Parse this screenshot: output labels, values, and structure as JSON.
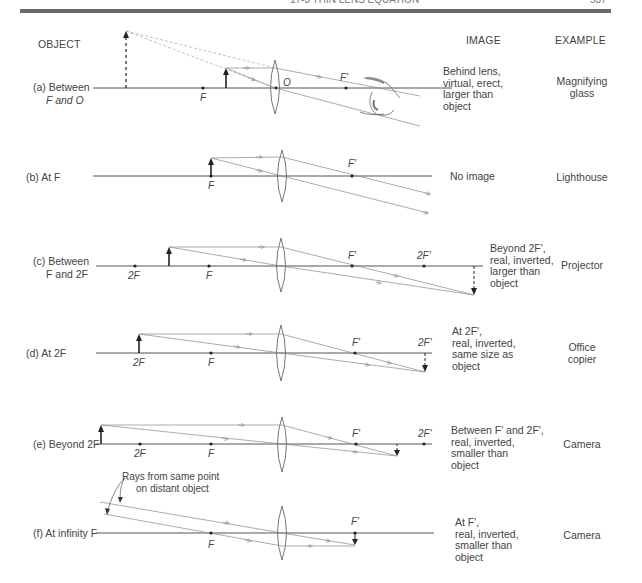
{
  "header": {
    "section_title": "17-3 THIN LENS EQUATION",
    "page_number": "537"
  },
  "columns": {
    "object": "OBJECT",
    "image": "IMAGE",
    "example": "EXAMPLE"
  },
  "cases": [
    {
      "id": "a",
      "label_line1": "(a) Between",
      "label_line2": "F and O",
      "points": [
        "F",
        "O",
        "F'"
      ],
      "image_lines": [
        "Behind lens,",
        "virtual, erect,",
        "larger than",
        "object"
      ],
      "example_lines": [
        "Magnifying",
        "glass"
      ]
    },
    {
      "id": "b",
      "label_line1": "(b) At F",
      "label_line2": "",
      "points": [
        "F",
        "F'"
      ],
      "image_lines": [
        "No image"
      ],
      "example_lines": [
        "Lighthouse"
      ]
    },
    {
      "id": "c",
      "label_line1": "(c) Between",
      "label_line2": "F and 2F",
      "points": [
        "2F",
        "F",
        "F'",
        "2F'"
      ],
      "image_lines": [
        "Beyond 2F',",
        "real, inverted,",
        "larger than",
        "object"
      ],
      "example_lines": [
        "Projector"
      ]
    },
    {
      "id": "d",
      "label_line1": "(d) At 2F",
      "label_line2": "",
      "points": [
        "2F",
        "F",
        "F'",
        "2F'"
      ],
      "image_lines": [
        "At 2F',",
        "real, inverted,",
        "same size as",
        "object"
      ],
      "example_lines": [
        "Office",
        "copier"
      ]
    },
    {
      "id": "e",
      "label_line1": "(e) Beyond 2F",
      "label_line2": "",
      "points": [
        "2F",
        "F",
        "F'",
        "2F'"
      ],
      "image_lines": [
        "Between F' and 2F',",
        "real, inverted,",
        "smaller than",
        "object"
      ],
      "example_lines": [
        "Camera"
      ]
    },
    {
      "id": "f",
      "label_line1": "(f) At infinity F",
      "label_line2": "",
      "points": [
        "F",
        "F'"
      ],
      "annotation_line1": "Rays from same point",
      "annotation_line2": "on distant object",
      "image_lines": [
        "At F',",
        "real, inverted,",
        "smaller than",
        "object"
      ],
      "example_lines": [
        "Camera"
      ]
    }
  ],
  "colors": {
    "line": "#555555",
    "ray": "#8a8a8a",
    "text": "#444444",
    "rule": "#6a6a6a"
  }
}
